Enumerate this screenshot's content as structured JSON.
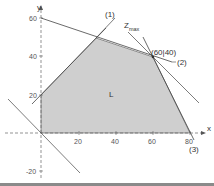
{
  "diagram": {
    "type": "linear-programming-feasible-region",
    "axes": {
      "x_label": "x",
      "y_label": "y",
      "x_ticks": [
        "20",
        "40",
        "60",
        "80"
      ],
      "y_ticks": [
        "60",
        "40",
        "20",
        "-20"
      ]
    },
    "region": {
      "label": "L",
      "vertices": [
        [
          0,
          0
        ],
        [
          0,
          20
        ],
        [
          30,
          50
        ],
        [
          60,
          40
        ],
        [
          80,
          0
        ]
      ],
      "fill": "#cfcfcf"
    },
    "constraints": [
      {
        "label": "(1)",
        "description": "line through (0|20) and (30|50)"
      },
      {
        "label": "(2)",
        "description": "line through (0|60) and (60|40)"
      },
      {
        "label": "(3)",
        "description": "line through (60|40) and (80|0)"
      }
    ],
    "objective": {
      "label": "Z",
      "subscript": "max",
      "optimum_label": "(60|40)"
    },
    "colors": {
      "line": "#444444",
      "axis": "#555555",
      "region": "#cfcfcf"
    }
  }
}
